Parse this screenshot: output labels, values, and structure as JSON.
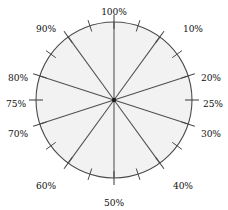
{
  "figure": {
    "name": "percentage-dial",
    "background_color": "#ffffff",
    "width": 228,
    "height": 210
  },
  "chart_data": {
    "type": "pie",
    "title": "",
    "subtitle": "",
    "xlabel": "",
    "ylabel": "",
    "legend_position": "none",
    "grid": false,
    "center": {
      "x": 114,
      "y": 100
    },
    "radius": 78,
    "start_angle_deg": 0,
    "direction": "clockwise",
    "units": "percent",
    "range": [
      0,
      100
    ],
    "fill_color": "#f2f2f2",
    "stroke_color": "#4a4a4a",
    "label_color": "#111111",
    "categories": [
      "100%",
      "10%",
      "20%",
      "25%",
      "30%",
      "40%",
      "50%",
      "60%",
      "70%",
      "75%",
      "80%",
      "90%"
    ],
    "values": [
      100,
      10,
      20,
      25,
      30,
      40,
      50,
      60,
      70,
      75,
      80,
      90
    ],
    "labels": [
      {
        "text": "100%",
        "percent": 100,
        "angle_deg": 0,
        "spoke": true,
        "tick": "major",
        "lx": 114,
        "ly": 12,
        "anchor": "middle"
      },
      {
        "text": "10%",
        "percent": 10,
        "angle_deg": 36,
        "spoke": true,
        "tick": "major",
        "lx": 183,
        "ly": 29,
        "anchor": "start"
      },
      {
        "text": "20%",
        "percent": 20,
        "angle_deg": 72,
        "spoke": true,
        "tick": "major",
        "lx": 201,
        "ly": 78,
        "anchor": "start"
      },
      {
        "text": "25%",
        "percent": 25,
        "angle_deg": 90,
        "spoke": false,
        "tick": "major",
        "lx": 203,
        "ly": 104,
        "anchor": "start"
      },
      {
        "text": "30%",
        "percent": 30,
        "angle_deg": 108,
        "spoke": true,
        "tick": "major",
        "lx": 201,
        "ly": 134,
        "anchor": "start"
      },
      {
        "text": "40%",
        "percent": 40,
        "angle_deg": 144,
        "spoke": true,
        "tick": "major",
        "lx": 173,
        "ly": 186,
        "anchor": "start"
      },
      {
        "text": "50%",
        "percent": 50,
        "angle_deg": 180,
        "spoke": true,
        "tick": "major",
        "lx": 114,
        "ly": 203,
        "anchor": "middle"
      },
      {
        "text": "60%",
        "percent": 60,
        "angle_deg": 216,
        "spoke": true,
        "tick": "major",
        "lx": 56,
        "ly": 186,
        "anchor": "end"
      },
      {
        "text": "70%",
        "percent": 70,
        "angle_deg": 252,
        "spoke": true,
        "tick": "major",
        "lx": 28,
        "ly": 134,
        "anchor": "end"
      },
      {
        "text": "75%",
        "percent": 75,
        "angle_deg": 270,
        "spoke": false,
        "tick": "major",
        "lx": 26,
        "ly": 104,
        "anchor": "end"
      },
      {
        "text": "80%",
        "percent": 80,
        "angle_deg": 288,
        "spoke": true,
        "tick": "major",
        "lx": 28,
        "ly": 78,
        "anchor": "end"
      },
      {
        "text": "90%",
        "percent": 90,
        "angle_deg": 324,
        "spoke": true,
        "tick": "major",
        "lx": 56,
        "ly": 29,
        "anchor": "end"
      }
    ],
    "minor_ticks": [
      {
        "percent": 5,
        "angle_deg": 18
      },
      {
        "percent": 15,
        "angle_deg": 54
      },
      {
        "percent": 35,
        "angle_deg": 126
      },
      {
        "percent": 45,
        "angle_deg": 162
      },
      {
        "percent": 55,
        "angle_deg": 198
      },
      {
        "percent": 65,
        "angle_deg": 234
      },
      {
        "percent": 85,
        "angle_deg": 306
      },
      {
        "percent": 95,
        "angle_deg": 342
      }
    ],
    "spokes": [
      {
        "percent": 100,
        "angle_deg": 0
      },
      {
        "percent": 10,
        "angle_deg": 36
      },
      {
        "percent": 20,
        "angle_deg": 72
      },
      {
        "percent": 30,
        "angle_deg": 108
      },
      {
        "percent": 40,
        "angle_deg": 144
      },
      {
        "percent": 50,
        "angle_deg": 180
      },
      {
        "percent": 60,
        "angle_deg": 216
      },
      {
        "percent": 70,
        "angle_deg": 252
      },
      {
        "percent": 80,
        "angle_deg": 288
      },
      {
        "percent": 90,
        "angle_deg": 324
      }
    ]
  }
}
